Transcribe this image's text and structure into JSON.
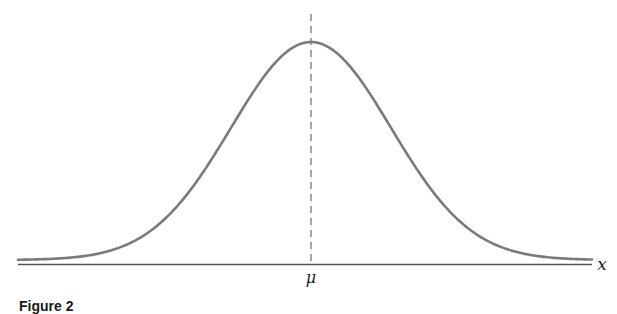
{
  "chart_data": {
    "type": "line",
    "title": "",
    "xlabel": "x",
    "ylabel": "",
    "tick_labels": [
      "μ"
    ],
    "series": [
      {
        "name": "normal density",
        "function": "gaussian",
        "mean_label": "μ",
        "x": [
          -3.6,
          -3,
          -2.5,
          -2,
          -1.5,
          -1,
          -0.5,
          0,
          0.5,
          1,
          1.5,
          2,
          2.5,
          3,
          3.6
        ],
        "y": [
          0.0015,
          0.011,
          0.044,
          0.135,
          0.325,
          0.607,
          0.882,
          1.0,
          0.882,
          0.607,
          0.325,
          0.135,
          0.044,
          0.011,
          0.0015
        ]
      }
    ],
    "annotations": [
      {
        "type": "dashed-vline",
        "at": "μ"
      }
    ],
    "grid": false,
    "legend": null,
    "colors": {
      "curve": "#7a7a7a",
      "axis": "#555555",
      "dashed": "#777777"
    }
  },
  "labels": {
    "x_axis": "x",
    "mu": "μ",
    "caption": "Figure 2"
  }
}
